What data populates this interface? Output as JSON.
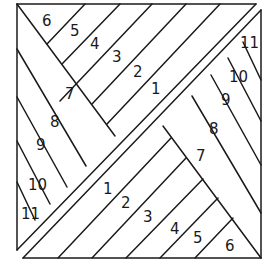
{
  "diagram": {
    "upper_left_labels": {
      "s6": "6",
      "s5": "5",
      "s4": "4",
      "s3": "3",
      "s2": "2",
      "s1": "1",
      "s7": "7",
      "s8": "8",
      "s9": "9",
      "s10": "10",
      "s11": "11"
    },
    "right_labels": {
      "s11": "11",
      "s10": "10",
      "s9": "9",
      "s8": "8",
      "s7": "7"
    },
    "lower_labels": {
      "s1": "1",
      "s2": "2",
      "s3": "3",
      "s4": "4",
      "s5": "5",
      "s6": "6"
    },
    "stroke_color": "#1a1a1a",
    "background_color": "#ffffff"
  }
}
